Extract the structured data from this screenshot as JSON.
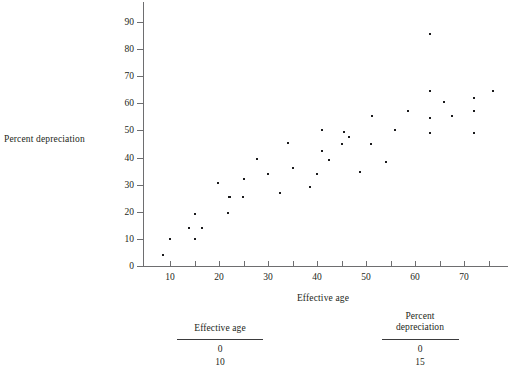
{
  "chart_data": {
    "type": "scatter",
    "title": "",
    "xlabel": "Effective age",
    "ylabel": "Percent depreciation",
    "xlim": [
      5,
      78
    ],
    "ylim": [
      0,
      95
    ],
    "xticks": [
      10,
      20,
      30,
      40,
      50,
      60,
      70
    ],
    "xminorticks": [
      15,
      25,
      35,
      45,
      55,
      65,
      75
    ],
    "yticks": [
      0,
      10,
      20,
      30,
      40,
      50,
      60,
      70,
      80,
      90
    ],
    "grid": false,
    "legend": null,
    "points": [
      {
        "x": 8.5,
        "y": 4
      },
      {
        "x": 10,
        "y": 10
      },
      {
        "x": 13.8,
        "y": 14
      },
      {
        "x": 15,
        "y": 10
      },
      {
        "x": 15.2,
        "y": 19
      },
      {
        "x": 16.5,
        "y": 14
      },
      {
        "x": 19.8,
        "y": 30.5
      },
      {
        "x": 21.8,
        "y": 19.5
      },
      {
        "x": 22,
        "y": 25.5
      },
      {
        "x": 22.2,
        "y": 25.5
      },
      {
        "x": 24.8,
        "y": 25.5
      },
      {
        "x": 25,
        "y": 32
      },
      {
        "x": 27.8,
        "y": 39.5
      },
      {
        "x": 30,
        "y": 34
      },
      {
        "x": 32.5,
        "y": 27
      },
      {
        "x": 34,
        "y": 45.5
      },
      {
        "x": 35,
        "y": 36
      },
      {
        "x": 38.5,
        "y": 29
      },
      {
        "x": 40,
        "y": 34
      },
      {
        "x": 41,
        "y": 42.5
      },
      {
        "x": 41,
        "y": 50
      },
      {
        "x": 42.5,
        "y": 39
      },
      {
        "x": 45,
        "y": 45
      },
      {
        "x": 45.5,
        "y": 49.5
      },
      {
        "x": 46.5,
        "y": 47.5
      },
      {
        "x": 48.8,
        "y": 34.5
      },
      {
        "x": 51,
        "y": 45
      },
      {
        "x": 51.2,
        "y": 55.5
      },
      {
        "x": 54,
        "y": 38.5
      },
      {
        "x": 56,
        "y": 50
      },
      {
        "x": 58.5,
        "y": 57
      },
      {
        "x": 63,
        "y": 85.5
      },
      {
        "x": 63,
        "y": 64.5
      },
      {
        "x": 63,
        "y": 54.5
      },
      {
        "x": 63,
        "y": 49
      },
      {
        "x": 66,
        "y": 60.5
      },
      {
        "x": 67.5,
        "y": 55.5
      },
      {
        "x": 72,
        "y": 62
      },
      {
        "x": 72,
        "y": 57
      },
      {
        "x": 72,
        "y": 49
      },
      {
        "x": 76,
        "y": 64.5
      }
    ]
  },
  "table": {
    "columns": [
      {
        "header": "Effective age",
        "values": [
          "0",
          "10"
        ]
      },
      {
        "header": "Percent\ndepreciation",
        "values": [
          "0",
          "15"
        ]
      }
    ]
  }
}
